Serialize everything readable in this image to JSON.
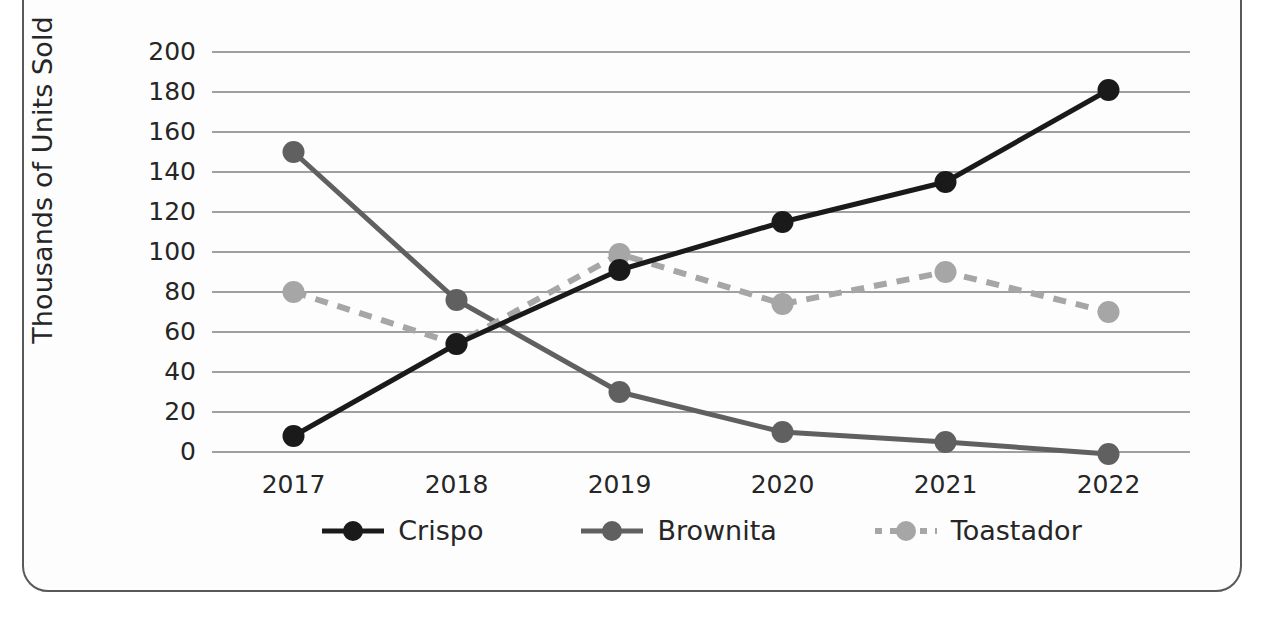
{
  "chart_data": {
    "type": "line",
    "title": "",
    "xlabel": "",
    "ylabel": "Thousands of Units Sold",
    "categories": [
      "2017",
      "2018",
      "2019",
      "2020",
      "2021",
      "2022"
    ],
    "x": [
      2017,
      2018,
      2019,
      2020,
      2021,
      2022
    ],
    "ylim": [
      0,
      200
    ],
    "ytick_step": 20,
    "yticks": [
      "0",
      "20",
      "40",
      "60",
      "80",
      "100",
      "120",
      "140",
      "160",
      "180",
      "200"
    ],
    "grid": true,
    "legend_position": "bottom",
    "series": [
      {
        "name": "Crispo",
        "values": [
          8,
          54,
          91,
          115,
          135,
          181
        ],
        "color": "#1a1a1a",
        "style": "solid",
        "marker": "circle"
      },
      {
        "name": "Brownita",
        "values": [
          150,
          76,
          30,
          10,
          5,
          -1
        ],
        "color": "#606060",
        "style": "solid",
        "marker": "circle"
      },
      {
        "name": "Toastador",
        "values": [
          80,
          54,
          99,
          74,
          90,
          70
        ],
        "color": "#a6a6a6",
        "style": "dashed",
        "marker": "circle"
      }
    ]
  },
  "axis": {
    "y_title": "Thousands of Units Sold"
  },
  "legend": {
    "items": [
      {
        "label": "Crispo"
      },
      {
        "label": "Brownita"
      },
      {
        "label": "Toastador"
      }
    ]
  },
  "colors": {
    "crispo": "#1a1a1a",
    "brownita": "#606060",
    "toastador": "#a6a6a6",
    "gridline": "#808080",
    "frame": "#595959",
    "text": "#262626"
  }
}
